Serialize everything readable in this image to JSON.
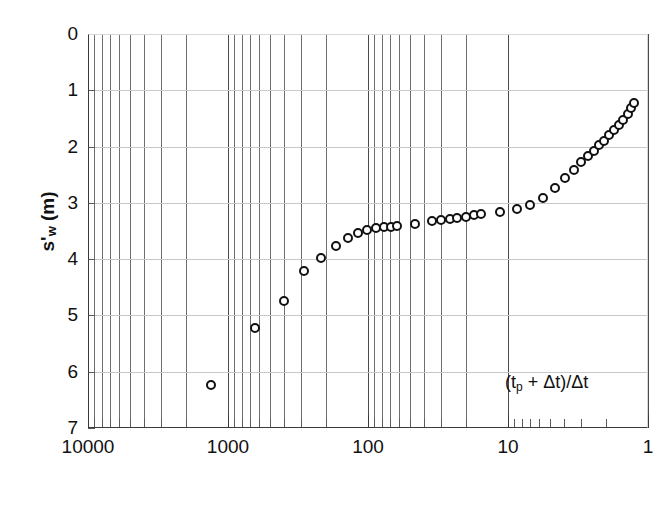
{
  "chart_data": {
    "type": "scatter",
    "title": "",
    "xlabel": "(tp + Δt)/Δt",
    "ylabel": "s'w (m)",
    "ylabel_base": "s'",
    "ylabel_sub": "w",
    "ylabel_unit": " (m)",
    "annotation_prefix": "(t",
    "annotation_sub": "p",
    "annotation_suffix": " + Δt)/Δt",
    "x_scale": "log",
    "x_reversed": true,
    "xlim": [
      10000,
      1
    ],
    "ylim": [
      0,
      7
    ],
    "y_inverted": true,
    "grid": true,
    "grid_minor_x": true,
    "legend": "none",
    "marker": "open-circle",
    "x_tick_labels": [
      "10000",
      "1000",
      "100",
      "10",
      "1"
    ],
    "x_tick_values": [
      10000,
      1000,
      100,
      10,
      1
    ],
    "y_tick_labels": [
      "0",
      "1",
      "2",
      "3",
      "4",
      "5",
      "6",
      "7"
    ],
    "y_tick_values": [
      0,
      1,
      2,
      3,
      4,
      5,
      6,
      7
    ],
    "x": [
      1320,
      640,
      400,
      285,
      215,
      170,
      138,
      118,
      101,
      88,
      77,
      69,
      62,
      46,
      35,
      30,
      26,
      23,
      20,
      17.5,
      15.5,
      11.5,
      8.6,
      7.0,
      5.6,
      4.6,
      3.9,
      3.4,
      3.0,
      2.7,
      2.45,
      2.25,
      2.05,
      1.9,
      1.75,
      1.62,
      1.5,
      1.4,
      1.32,
      1.26
    ],
    "y": [
      6.24,
      5.22,
      4.74,
      4.21,
      3.98,
      3.76,
      3.62,
      3.53,
      3.48,
      3.45,
      3.43,
      3.42,
      3.41,
      3.38,
      3.32,
      3.3,
      3.28,
      3.27,
      3.25,
      3.22,
      3.2,
      3.16,
      3.11,
      3.04,
      2.92,
      2.73,
      2.56,
      2.42,
      2.28,
      2.17,
      2.07,
      1.98,
      1.9,
      1.8,
      1.7,
      1.61,
      1.52,
      1.42,
      1.32,
      1.23
    ],
    "n_points": 40
  },
  "axes": {
    "y_title_text": "s'w (m)"
  }
}
